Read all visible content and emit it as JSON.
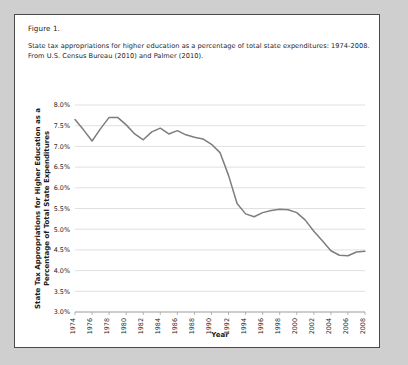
{
  "figure": {
    "label": "Figure 1.",
    "caption_line_1": "State tax appropriations for higher education as a percentage of total state expenditures: 1974-2008.",
    "caption_line_2": "From U.S. Census Bureau (2010) and Palmer (2010)."
  },
  "colors": {
    "line": "#7d7d7d",
    "grid": "#d2d2d2",
    "axis": "#9a9a9a",
    "frame_border": "#4a4a4a",
    "page_background": "#cfcfcf",
    "figure_background": "#ffffff",
    "text": "#1c1c1c"
  },
  "chart_data": {
    "type": "line",
    "title": "",
    "xlabel": "Year",
    "ylabel": "State Tax Appropriations for Higher Education as a Percentage of Total State Expenditures",
    "ylabel_line_1": "State Tax Appropriations for Higher Education as a",
    "ylabel_line_2": "Percentage of Total State Expenditures",
    "grid": true,
    "legend": "none",
    "xlim": [
      1974,
      2008
    ],
    "ylim": [
      3.0,
      8.0
    ],
    "ytick_step": 0.5,
    "ytick_labels": [
      "8.0%",
      "7.5%",
      "7.0%",
      "6.5%",
      "6.0%",
      "5.5%",
      "5.0%",
      "4.5%",
      "4.0%",
      "3.5%",
      "3.0%"
    ],
    "ytick_values": [
      8.0,
      7.5,
      7.0,
      6.5,
      6.0,
      5.5,
      5.0,
      4.5,
      4.0,
      3.5,
      3.0
    ],
    "xtick_labels": [
      "1974",
      "1976",
      "1978",
      "1980",
      "1982",
      "1984",
      "1986",
      "1988",
      "1990",
      "1992",
      "1994",
      "1996",
      "1998",
      "2000",
      "2002",
      "2004",
      "2006",
      "2008"
    ],
    "xtick_values": [
      1974,
      1976,
      1978,
      1980,
      1982,
      1984,
      1986,
      1988,
      1990,
      1992,
      1994,
      1996,
      1998,
      2000,
      2002,
      2004,
      2006,
      2008
    ],
    "x": [
      1974,
      1975,
      1976,
      1977,
      1978,
      1979,
      1980,
      1981,
      1982,
      1983,
      1984,
      1985,
      1986,
      1987,
      1988,
      1989,
      1990,
      1991,
      1992,
      1993,
      1994,
      1995,
      1996,
      1997,
      1998,
      1999,
      2000,
      2001,
      2002,
      2003,
      2004,
      2005,
      2006,
      2007,
      2008
    ],
    "values": [
      7.65,
      7.4,
      7.13,
      7.43,
      7.7,
      7.7,
      7.52,
      7.3,
      7.16,
      7.35,
      7.44,
      7.3,
      7.38,
      7.28,
      7.22,
      7.18,
      7.05,
      6.85,
      6.3,
      5.62,
      5.37,
      5.3,
      5.4,
      5.45,
      5.48,
      5.47,
      5.4,
      5.22,
      4.95,
      4.72,
      4.48,
      4.37,
      4.36,
      4.45,
      4.47
    ],
    "series": [
      {
        "name": "State tax appropriations for higher education (% of total state expenditures)",
        "values": [
          7.65,
          7.4,
          7.13,
          7.43,
          7.7,
          7.7,
          7.52,
          7.3,
          7.16,
          7.35,
          7.44,
          7.3,
          7.38,
          7.28,
          7.22,
          7.18,
          7.05,
          6.85,
          6.3,
          5.62,
          5.37,
          5.3,
          5.4,
          5.45,
          5.48,
          5.47,
          5.4,
          5.22,
          4.95,
          4.72,
          4.48,
          4.37,
          4.36,
          4.45,
          4.47
        ]
      }
    ]
  }
}
